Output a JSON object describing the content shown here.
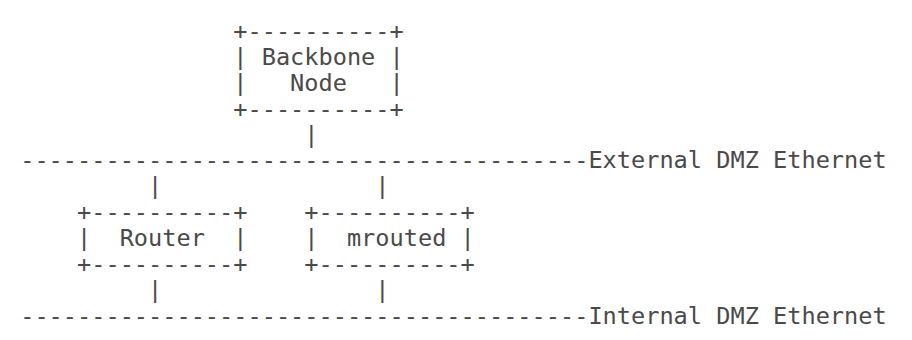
{
  "diagram": {
    "type": "ascii-network-diagram",
    "nodes": {
      "backbone": "Backbone Node",
      "router": "Router",
      "mrouted": "mrouted"
    },
    "networks": {
      "external": "External DMZ Ethernet",
      "internal": "Internal DMZ Ethernet"
    },
    "lines": [
      "                +----------+",
      "                | Backbone |",
      "                |   Node   |",
      "                +----------+",
      "                     |",
      " ----------------------------------------External DMZ Ethernet",
      "          |               |",
      "     +----------+    +----------+",
      "     |  Router  |    |  mrouted |",
      "     +----------+    +----------+",
      "          |               |",
      " ----------------------------------------Internal DMZ Ethernet"
    ]
  },
  "colors": {
    "text": "#4a4a4a",
    "background": "#ffffff"
  }
}
